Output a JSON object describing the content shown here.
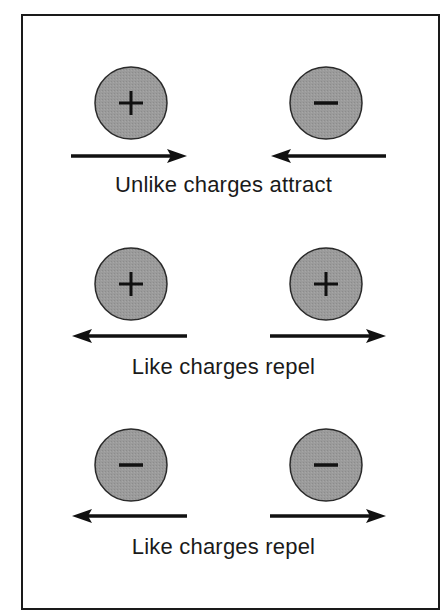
{
  "figure": {
    "colors": {
      "charge_fill": "#999999",
      "charge_stroke": "#2a2a2a",
      "arrow": "#111111",
      "frame": "#1a1a1a",
      "text": "#1a1a1a"
    },
    "rows": [
      {
        "left_charge": {
          "sign": "+",
          "label": "positive charge"
        },
        "right_charge": {
          "sign": "−",
          "label": "negative charge"
        },
        "left_arrow": "right",
        "right_arrow": "left",
        "caption": "Unlike charges attract"
      },
      {
        "left_charge": {
          "sign": "+",
          "label": "positive charge"
        },
        "right_charge": {
          "sign": "+",
          "label": "positive charge"
        },
        "left_arrow": "left",
        "right_arrow": "right",
        "caption": "Like charges repel"
      },
      {
        "left_charge": {
          "sign": "−",
          "label": "negative charge"
        },
        "right_charge": {
          "sign": "−",
          "label": "negative charge"
        },
        "left_arrow": "left",
        "right_arrow": "right",
        "caption": "Like charges repel"
      }
    ]
  }
}
